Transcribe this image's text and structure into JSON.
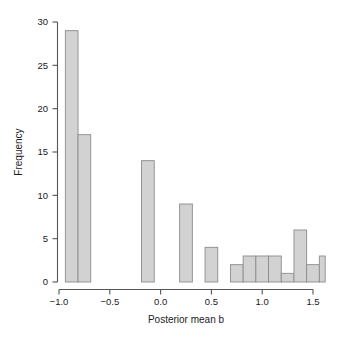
{
  "chart_data": {
    "type": "bar",
    "subtype": "histogram",
    "title": "",
    "xlabel": "Posterior mean b",
    "ylabel": "Frequency",
    "xlim": [
      -0.95,
      1.62
    ],
    "ylim": [
      0,
      30
    ],
    "grid": false,
    "legend": null,
    "bin_width": 0.125,
    "xticks": [
      -1.0,
      -0.5,
      0.0,
      0.5,
      1.0,
      1.5
    ],
    "xticklabels": [
      "−1.0",
      "−0.5",
      "0.0",
      "0.5",
      "1.0",
      "1.5"
    ],
    "yticks": [
      0,
      5,
      10,
      15,
      20,
      25,
      30
    ],
    "yticklabels": [
      "0",
      "5",
      "10",
      "15",
      "20",
      "25",
      "30"
    ],
    "bin_edges": [
      -0.9375,
      -0.8125,
      -0.6875,
      -0.5625,
      -0.4375,
      -0.3125,
      -0.1875,
      -0.0625,
      0.0625,
      0.1875,
      0.3125,
      0.4375,
      0.5625,
      0.6875,
      0.8125,
      0.9375,
      1.0625,
      1.1875,
      1.3125,
      1.4375,
      1.5625,
      1.6875
    ],
    "bins": [
      {
        "x0": -0.9375,
        "x1": -0.8125,
        "value": 29
      },
      {
        "x0": -0.8125,
        "x1": -0.6875,
        "value": 17
      },
      {
        "x0": -0.6875,
        "x1": -0.5625,
        "value": 0
      },
      {
        "x0": -0.5625,
        "x1": -0.4375,
        "value": 0
      },
      {
        "x0": -0.4375,
        "x1": -0.3125,
        "value": 0
      },
      {
        "x0": -0.3125,
        "x1": -0.1875,
        "value": 0
      },
      {
        "x0": -0.1875,
        "x1": -0.0625,
        "value": 14
      },
      {
        "x0": -0.0625,
        "x1": 0.0625,
        "value": 0
      },
      {
        "x0": 0.0625,
        "x1": 0.1875,
        "value": 0
      },
      {
        "x0": 0.1875,
        "x1": 0.3125,
        "value": 9
      },
      {
        "x0": 0.3125,
        "x1": 0.4375,
        "value": 0
      },
      {
        "x0": 0.4375,
        "x1": 0.5625,
        "value": 4
      },
      {
        "x0": 0.5625,
        "x1": 0.6875,
        "value": 0
      },
      {
        "x0": 0.6875,
        "x1": 0.8125,
        "value": 2
      },
      {
        "x0": 0.8125,
        "x1": 0.9375,
        "value": 3
      },
      {
        "x0": 0.9375,
        "x1": 1.0625,
        "value": 3
      },
      {
        "x0": 1.0625,
        "x1": 1.1875,
        "value": 3
      },
      {
        "x0": 1.1875,
        "x1": 1.3125,
        "value": 1
      },
      {
        "x0": 1.3125,
        "x1": 1.4375,
        "value": 6
      },
      {
        "x0": 1.4375,
        "x1": 1.5625,
        "value": 2
      },
      {
        "x0": 1.5625,
        "x1": 1.6875,
        "value": 3
      },
      {
        "x0": 1.6875,
        "x1": 1.8125,
        "value": 2
      },
      {
        "x0": 1.8125,
        "x1": 1.9375,
        "value": 1
      },
      {
        "x0": 1.9375,
        "x1": 2.0625,
        "value": 2
      }
    ],
    "colors": {
      "bar_fill": "#d2d2d2",
      "bar_stroke": "#8c8c8c",
      "axis": "#555555",
      "text": "#1a1a1a",
      "background": "#ffffff"
    }
  }
}
